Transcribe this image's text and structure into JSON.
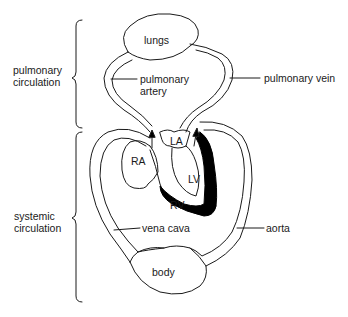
{
  "diagram": {
    "type": "circulatory-system",
    "brackets": {
      "pulmonary": "pulmonary circulation",
      "pulmonary_line1": "pulmonary",
      "pulmonary_line2": "circulation",
      "systemic_line1": "systemic",
      "systemic_line2": "circulation"
    },
    "labels": {
      "lungs": "lungs",
      "pulmonary_artery_line1": "pulmonary",
      "pulmonary_artery_line2": "artery",
      "pulmonary_vein": "pulmonary vein",
      "ra": "RA",
      "la": "LA",
      "lv": "LV",
      "rv": "RV",
      "vena_cava": "vena cava",
      "aorta": "aorta",
      "body": "body"
    },
    "colors": {
      "line": "#1a1a1a",
      "lv_wall": "#000000",
      "background": "#ffffff"
    }
  }
}
